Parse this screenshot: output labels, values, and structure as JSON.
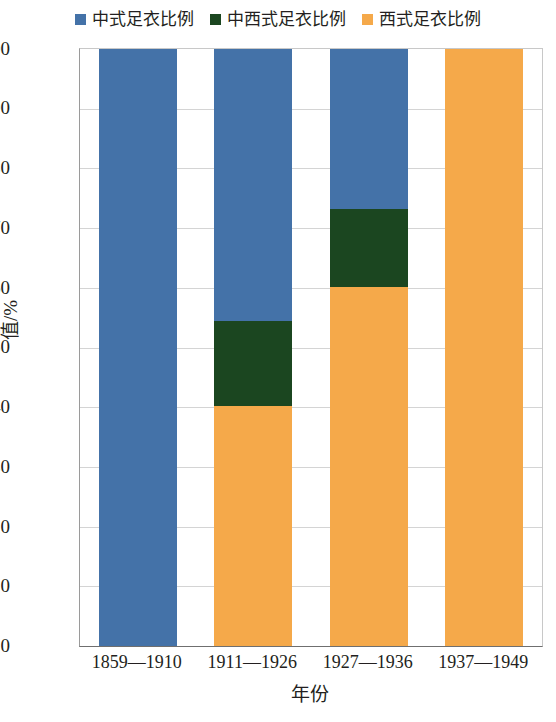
{
  "chart_data": {
    "type": "bar",
    "subtype": "stacked-bar-100-percent",
    "title": "",
    "xlabel": "年份",
    "ylabel": "值/%",
    "ylim": [
      0,
      100
    ],
    "yticks": [
      100,
      90,
      80,
      70,
      60,
      50,
      40,
      30,
      20,
      10,
      0
    ],
    "grid": true,
    "grid_axis": "y",
    "legend_position": "top-center",
    "categories": [
      "1859—1910",
      "1911—1926",
      "1927—1936",
      "1937—1949"
    ],
    "series": [
      {
        "name": "中式足衣比例",
        "color": "#4472A8",
        "values": [
          100.0,
          45.6,
          26.8,
          0.0
        ]
      },
      {
        "name": "中西式足衣比例",
        "color": "#1B4620",
        "values": [
          0.0,
          14.2,
          13.1,
          0.0
        ]
      },
      {
        "name": "西式足衣比例",
        "color": "#F5A94A",
        "values": [
          0.0,
          40.2,
          60.1,
          100.0
        ]
      }
    ],
    "stack_order": [
      "西式足衣比例",
      "中西式足衣比例",
      "中式足衣比例"
    ],
    "cumulative_tops": {
      "1859—1910": {
        "西式足衣比例": 0.0,
        "中西式足衣比例": 0.0,
        "中式足衣比例": 100.0
      },
      "1911—1926": {
        "西式足衣比例": 40.2,
        "中西式足衣比例": 54.4,
        "中式足衣比例": 100.0
      },
      "1927—1936": {
        "西式足衣比例": 60.1,
        "中西式足衣比例": 73.2,
        "中式足衣比例": 100.0
      },
      "1937—1949": {
        "西式足衣比例": 100.0,
        "中西式足衣比例": 100.0,
        "中式足衣比例": 100.0
      }
    }
  },
  "legend": {
    "items": [
      {
        "label": "中式足衣比例",
        "color": "#4472A8"
      },
      {
        "label": "中西式足衣比例",
        "color": "#1B4620"
      },
      {
        "label": "西式足衣比例",
        "color": "#F5A94A"
      }
    ]
  },
  "axes": {
    "y_title": "值/%",
    "x_title": "年份",
    "y_ticks": [
      "100",
      "90",
      "80",
      "70",
      "60",
      "50",
      "40",
      "30",
      "20",
      "10",
      "0"
    ],
    "x_ticks": [
      "1859—1910",
      "1911—1926",
      "1927—1936",
      "1937—1949"
    ]
  }
}
